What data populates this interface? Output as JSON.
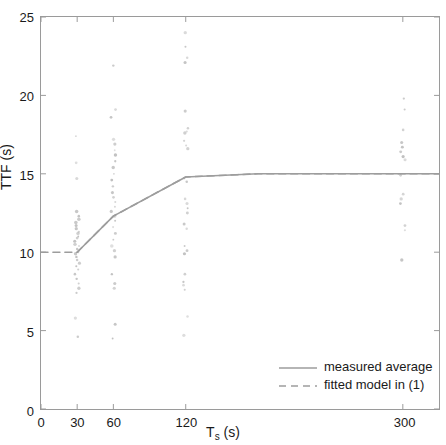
{
  "chart_data": {
    "type": "scatter",
    "title": "",
    "xlabel": "T_s (s)",
    "ylabel": "TTF (s)",
    "xlim": [
      0,
      330
    ],
    "ylim": [
      0,
      25
    ],
    "grid": false,
    "legend_position": "bottom-right",
    "xticks": [
      0,
      30,
      60,
      120,
      300
    ],
    "xtick_labels": [
      "0",
      "30",
      "60",
      "120",
      "300"
    ],
    "yticks": [
      0,
      5,
      10,
      15,
      20,
      25
    ],
    "ytick_labels": [
      "0",
      "5",
      "10",
      "15",
      "20",
      "25"
    ],
    "point_color": "#b9b9b9",
    "line_color": "#9d9d9d",
    "axis_color": "#9a9a9a",
    "scatter": [
      {
        "x": 30,
        "values": [
          17.4,
          15.7,
          14.7,
          12.6,
          12.3,
          12.1,
          11.9,
          11.7,
          11.5,
          11.3,
          11.2,
          11.0,
          10.9,
          10.7,
          10.5,
          10.4,
          10.2,
          10.1,
          10.0,
          9.9,
          9.7,
          9.5,
          9.3,
          9.1,
          8.9,
          8.6,
          8.3,
          8.0,
          7.7,
          7.4,
          5.8,
          4.6
        ]
      },
      {
        "x": 60,
        "values": [
          21.9,
          19.1,
          18.6,
          17.2,
          16.9,
          16.5,
          16.2,
          15.8,
          15.4,
          15.0,
          14.6,
          14.2,
          13.8,
          13.5,
          13.2,
          12.9,
          12.6,
          12.3,
          12.0,
          11.6,
          11.2,
          10.8,
          10.4,
          10.1,
          9.7,
          8.6,
          8.0,
          7.7,
          5.4,
          4.5
        ]
      },
      {
        "x": 120,
        "values": [
          24.0,
          23.1,
          22.4,
          22.1,
          19.0,
          17.9,
          17.7,
          17.6,
          17.1,
          16.8,
          16.6,
          14.7,
          14.5,
          13.4,
          13.1,
          12.8,
          12.5,
          11.8,
          11.5,
          10.4,
          10.1,
          9.9,
          8.6,
          8.1,
          7.9,
          7.6,
          5.9,
          4.7
        ]
      },
      {
        "x": 300,
        "values": [
          19.8,
          19.1,
          17.8,
          17.0,
          16.7,
          16.4,
          16.1,
          15.9,
          14.9,
          13.7,
          13.4,
          13.1,
          11.7,
          11.4,
          9.5
        ]
      }
    ],
    "series": [
      {
        "name": "measured average",
        "style": "solid",
        "points": [
          {
            "x": 30,
            "y": 10.0
          },
          {
            "x": 60,
            "y": 12.3
          },
          {
            "x": 120,
            "y": 14.8
          },
          {
            "x": 180,
            "y": 15.0
          },
          {
            "x": 240,
            "y": 15.0
          },
          {
            "x": 300,
            "y": 15.0
          },
          {
            "x": 330,
            "y": 15.0
          }
        ]
      },
      {
        "name": "fitted model in (1)",
        "style": "dashed",
        "points": [
          {
            "x": 0,
            "y": 10.0
          },
          {
            "x": 30,
            "y": 10.0
          },
          {
            "x": 60,
            "y": 12.3
          },
          {
            "x": 120,
            "y": 14.8
          },
          {
            "x": 180,
            "y": 15.0
          },
          {
            "x": 240,
            "y": 15.0
          },
          {
            "x": 300,
            "y": 15.0
          },
          {
            "x": 330,
            "y": 15.0
          }
        ]
      }
    ],
    "legend": [
      {
        "label": "measured average",
        "style": "solid"
      },
      {
        "label": "fitted model in (1)",
        "style": "dashed"
      }
    ]
  }
}
